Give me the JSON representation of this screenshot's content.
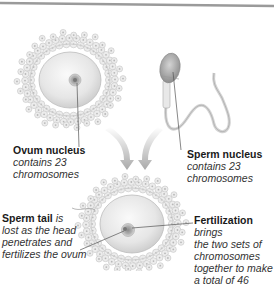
{
  "diagram": {
    "title": "Fertilization",
    "colors": {
      "top_rule": "#9a9a9a",
      "cell_fill": "#eeeeee",
      "corona_cell": "#e4e4e4",
      "nucleus": "#a8a8a8",
      "arrow": "#b5b5b5",
      "leader_line": "#555555"
    },
    "labels": {
      "ovum_nucleus": {
        "title": "Ovum nucleus",
        "line1": "contains 23",
        "line2": "chromosomes"
      },
      "sperm_nucleus": {
        "title": "Sperm nucleus",
        "line1": "contains 23",
        "line2": "chromosomes"
      },
      "sperm_tail": {
        "title": "Sperm tail",
        "title_suffix": " is",
        "line1": "lost as the head",
        "line2": "penetrates and",
        "line3": "fertilizes the ovum"
      },
      "fertilization": {
        "title": "Fertilization",
        "title_suffix": " brings",
        "line1": "the two sets of",
        "line2": "chromosomes",
        "line3": "together to make",
        "line4": "a total of 46"
      }
    },
    "icons": {
      "ovum": "ovum-illustration",
      "sperm": "sperm-illustration",
      "zygote": "fertilized-ovum-illustration",
      "arrows": "down-arrow-icon"
    }
  }
}
